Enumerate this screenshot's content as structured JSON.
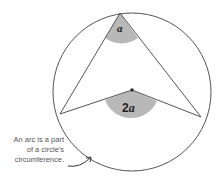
{
  "diagram": {
    "angle_inscribed_label": "a",
    "angle_central_label": "2a",
    "caption_lines": [
      "An arc is a part",
      "of a circle's",
      "circumference."
    ],
    "colors": {
      "stroke": "#555555",
      "shade": "#b8b8b8",
      "background": "#ffffff"
    }
  }
}
